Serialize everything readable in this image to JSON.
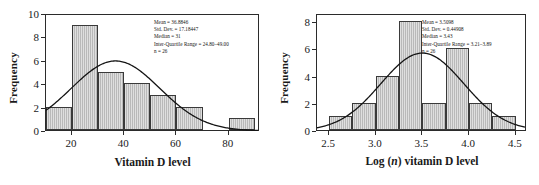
{
  "figure": {
    "panels": [
      {
        "id": "vitamin-d-raw",
        "ylabel": "Frequency",
        "xlabel_prefix": "Vitamin D level",
        "xlabel_italic": "",
        "xlabel_suffix": "",
        "stats": {
          "mean": "Mean = 36.8846",
          "sd": "Std. Dev. = 17.18447",
          "median": "Median = 31",
          "iqr": "Inter-Quartile Range = 24.80–49.00",
          "n": "n = 26"
        },
        "yticks": [
          "0",
          "2",
          "4",
          "6",
          "8",
          "10"
        ],
        "xticks": [
          "20",
          "40",
          "60",
          "80"
        ]
      },
      {
        "id": "vitamin-d-log",
        "ylabel": "Frequency",
        "xlabel_prefix": "Log (",
        "xlabel_italic": "n",
        "xlabel_suffix": ") vitamin D level",
        "stats": {
          "mean": "Mean = 3.5098",
          "sd": "Std. Dev. = 0.44908",
          "median": "Median = 3.43",
          "iqr": "Inter-Quartile Range = 3.21–3.89",
          "n": "n = 26"
        },
        "yticks": [
          "0",
          "2",
          "4",
          "6",
          "8"
        ],
        "xticks": [
          "2.5",
          "3.0",
          "3.5",
          "4.0",
          "4.5"
        ]
      }
    ]
  },
  "chart_data": [
    {
      "type": "bar",
      "title": "",
      "subtitle": "",
      "xlabel": "Vitamin D level",
      "ylabel": "Frequency",
      "xlim": [
        10,
        92
      ],
      "ylim": [
        0,
        10
      ],
      "xticks": [
        20,
        40,
        60,
        80
      ],
      "yticks": [
        0,
        2,
        4,
        6,
        8,
        10
      ],
      "grid": false,
      "legend": "none",
      "bin_width": 10,
      "bin_edges": [
        10,
        20,
        30,
        40,
        50,
        60,
        70,
        80,
        90
      ],
      "categories": [
        "10-20",
        "20-30",
        "30-40",
        "40-50",
        "50-60",
        "60-70",
        "70-80",
        "80-90"
      ],
      "values": [
        2,
        9,
        5,
        4,
        3,
        2,
        0,
        1
      ],
      "overlay": {
        "type": "normal-curve",
        "mean": 36.8846,
        "sd": 17.18447,
        "n": 26,
        "scale_bin_width": 10
      },
      "annotations": [
        "Mean = 36.8846",
        "Std. Dev. = 17.18447",
        "Median = 31",
        "Inter-Quartile Range = 24.80-49.00",
        "n = 26"
      ]
    },
    {
      "type": "bar",
      "title": "",
      "subtitle": "",
      "xlabel": "Log (n) vitamin D level",
      "ylabel": "Frequency",
      "xlim": [
        2.37,
        4.62
      ],
      "ylim": [
        0,
        8.6
      ],
      "xticks": [
        2.5,
        3.0,
        3.5,
        4.0,
        4.5
      ],
      "yticks": [
        0,
        2,
        4,
        6,
        8
      ],
      "grid": false,
      "legend": "none",
      "bin_width": 0.25,
      "bin_edges": [
        2.5,
        2.75,
        3.0,
        3.25,
        3.5,
        3.75,
        4.0,
        4.25,
        4.5
      ],
      "categories": [
        "2.50-2.75",
        "2.75-3.00",
        "3.00-3.25",
        "3.25-3.50",
        "3.50-3.75",
        "3.75-4.00",
        "4.00-4.25",
        "4.25-4.50"
      ],
      "values": [
        1,
        2,
        4,
        8,
        2,
        6,
        2,
        1
      ],
      "overlay": {
        "type": "normal-curve",
        "mean": 3.5098,
        "sd": 0.44908,
        "n": 26,
        "scale_bin_width": 0.25
      },
      "annotations": [
        "Mean = 3.5098",
        "Std. Dev. = 0.44908",
        "Median = 3.43",
        "Inter-Quartile Range = 3.21-3.89",
        "n = 26"
      ]
    }
  ]
}
